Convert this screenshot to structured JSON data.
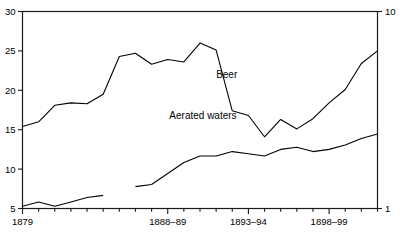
{
  "chart_data": {
    "type": "line",
    "title": "",
    "subtitle": "",
    "xlabel": "",
    "ylabel": "",
    "grid": false,
    "legend_position": "inline-annotation",
    "x_axis": {
      "tick_labels": [
        "1879",
        "1888–89",
        "1893–94",
        "1898–99"
      ],
      "tick_label_years": [
        1879,
        1888,
        1893,
        1898
      ],
      "minor_tick_interval_years": 1,
      "range_years": [
        1879,
        1901
      ]
    },
    "y_axis_left": {
      "label": "",
      "ticks": [
        5,
        10,
        15,
        20,
        25,
        30
      ],
      "tick_labels": [
        "5",
        "10",
        "15",
        "20",
        "25",
        "30"
      ],
      "ylim": [
        5,
        30
      ],
      "applies_to": "Beer"
    },
    "y_axis_right": {
      "label": "",
      "ticks": [
        1,
        10
      ],
      "tick_labels": [
        "1",
        "10"
      ],
      "ylim": [
        1,
        10
      ],
      "applies_to": "Aerated waters"
    },
    "annotations": [
      {
        "text": "Beer",
        "x_year": 1891.0,
        "y_value": 21.6,
        "axis": "left"
      },
      {
        "text": "Aerated waters",
        "x_year": 1888.1,
        "y_value": 5.1,
        "axis": "right"
      }
    ],
    "series": [
      {
        "name": "Beer",
        "axis": "left",
        "color": "#000000",
        "x": [
          1879,
          1880,
          1881,
          1882,
          1883,
          1884,
          1885,
          1886,
          1887,
          1888,
          1889,
          1890,
          1891,
          1892,
          1893,
          1894,
          1895,
          1896,
          1897,
          1898,
          1899,
          1900,
          1901
        ],
        "values": [
          15.4,
          16.0,
          18.1,
          18.4,
          18.3,
          19.5,
          24.3,
          24.7,
          23.3,
          23.9,
          23.6,
          26.0,
          25.1,
          17.4,
          16.8,
          14.1,
          16.3,
          15.1,
          16.4,
          18.4,
          20.1,
          23.4,
          25.0
        ]
      },
      {
        "name": "Aerated waters",
        "axis": "right",
        "color": "#000000",
        "break_after_year": 1884,
        "x": [
          1879,
          1880,
          1881,
          1882,
          1883,
          1884,
          1886,
          1887,
          1888,
          1889,
          1890,
          1891,
          1892,
          1893,
          1894,
          1895,
          1896,
          1897,
          1898,
          1899,
          1900,
          1901
        ],
        "values": [
          1.1,
          1.3,
          1.1,
          1.3,
          1.5,
          1.6,
          2.0,
          2.1,
          2.6,
          3.1,
          3.4,
          3.4,
          3.6,
          3.5,
          3.4,
          3.7,
          3.8,
          3.6,
          3.7,
          3.9,
          4.2,
          4.4
        ]
      }
    ]
  },
  "axis_left_labels": [
    "30",
    "25",
    "20",
    "15",
    "10",
    "5"
  ],
  "axis_right_labels": [
    "10",
    "1"
  ],
  "axis_x_labels": [
    "1879",
    "1888–89",
    "1893–94",
    "1898–99"
  ],
  "series_names": {
    "beer": "Beer",
    "aerated": "Aerated waters"
  }
}
